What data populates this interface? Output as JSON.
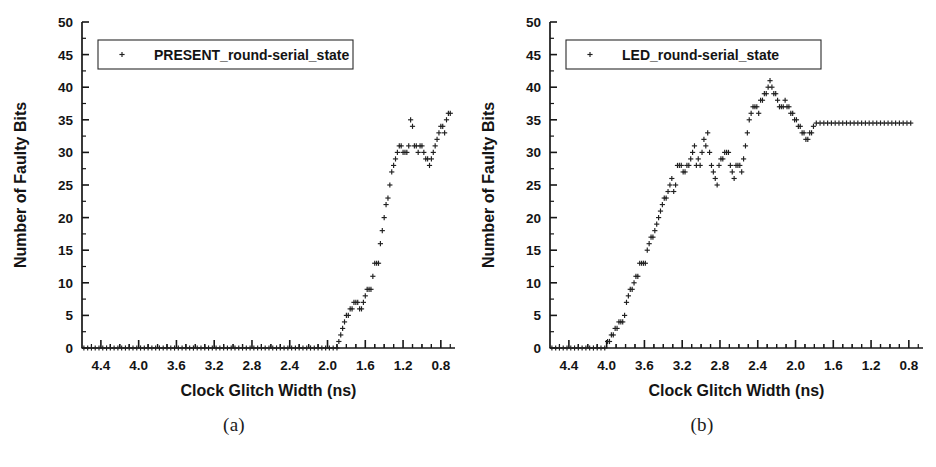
{
  "figure": {
    "panels": [
      {
        "id": "a",
        "caption": "(a)",
        "legend_label": "PRESENT_round-serial_state",
        "marker_symbol": "+"
      },
      {
        "id": "b",
        "caption": "(b)",
        "legend_label": "LED_round-serial_state",
        "marker_symbol": "+"
      }
    ]
  },
  "chart_data": [
    {
      "type": "scatter",
      "title": "",
      "panel": "(a)",
      "xlabel": "Clock Glitch Width (ns)",
      "ylabel": "Number of Faulty Bits",
      "legend": [
        "PRESENT_round-serial_state"
      ],
      "legend_position": "top-left",
      "grid": false,
      "x_axis_reversed": true,
      "xlim": [
        4.6,
        0.65
      ],
      "ylim": [
        0,
        50
      ],
      "xticks": [
        4.4,
        4.0,
        3.6,
        3.2,
        2.8,
        2.4,
        2.0,
        1.6,
        1.2,
        0.8
      ],
      "xtick_labels": [
        "4.4",
        "4.0",
        "3.6",
        "3.2",
        "2.8",
        "2.4",
        "2.0",
        "1.6",
        "1.2",
        "0.8"
      ],
      "yticks": [
        0,
        5,
        10,
        15,
        20,
        25,
        30,
        35,
        40,
        45,
        50
      ],
      "ytick_labels": [
        "0",
        "5",
        "10",
        "15",
        "20",
        "25",
        "30",
        "35",
        "40",
        "45",
        "50"
      ],
      "x_minor_ticks_per_major": 2,
      "y_minor_ticks_per_major": 1,
      "series": [
        {
          "name": "PRESENT_round-serial_state",
          "marker": "+",
          "color": "#202020",
          "x": [
            4.58,
            4.54,
            4.5,
            4.46,
            4.42,
            4.38,
            4.34,
            4.3,
            4.26,
            4.22,
            4.18,
            4.14,
            4.1,
            4.06,
            4.02,
            3.98,
            3.94,
            3.9,
            3.86,
            3.82,
            3.78,
            3.74,
            3.7,
            3.66,
            3.62,
            3.58,
            3.54,
            3.5,
            3.46,
            3.42,
            3.38,
            3.34,
            3.3,
            3.26,
            3.22,
            3.18,
            3.14,
            3.1,
            3.06,
            3.02,
            2.98,
            2.94,
            2.9,
            2.86,
            2.82,
            2.78,
            2.74,
            2.7,
            2.66,
            2.62,
            2.58,
            2.54,
            2.5,
            2.46,
            2.42,
            2.38,
            2.34,
            2.3,
            2.26,
            2.22,
            2.18,
            2.14,
            2.1,
            2.06,
            2.02,
            1.98,
            1.94,
            1.9,
            1.88,
            1.86,
            1.84,
            1.82,
            1.8,
            1.78,
            1.76,
            1.74,
            1.72,
            1.7,
            1.68,
            1.66,
            1.64,
            1.62,
            1.6,
            1.58,
            1.56,
            1.54,
            1.52,
            1.5,
            1.48,
            1.46,
            1.44,
            1.42,
            1.4,
            1.38,
            1.36,
            1.34,
            1.32,
            1.3,
            1.28,
            1.26,
            1.24,
            1.22,
            1.2,
            1.18,
            1.16,
            1.14,
            1.12,
            1.1,
            1.08,
            1.06,
            1.04,
            1.02,
            1.0,
            0.98,
            0.96,
            0.94,
            0.92,
            0.9,
            0.88,
            0.86,
            0.84,
            0.82,
            0.8,
            0.78,
            0.76,
            0.74,
            0.72,
            0.7
          ],
          "y": [
            0,
            0,
            0,
            0,
            0,
            0,
            0,
            0,
            0,
            0,
            0,
            0,
            0,
            0,
            0,
            0,
            0,
            0,
            0,
            0,
            0,
            0,
            0,
            0,
            0,
            0,
            0,
            0,
            0,
            0,
            0,
            0,
            0,
            0,
            0,
            0,
            0,
            0,
            0,
            0,
            0,
            0,
            0,
            0,
            0,
            0,
            0,
            0,
            0,
            0,
            0,
            0,
            0,
            0,
            0,
            0,
            0,
            0,
            0,
            0,
            0,
            0,
            0,
            0,
            0,
            0,
            0,
            0,
            1,
            2,
            3,
            4,
            5,
            5,
            6,
            6,
            7,
            7,
            7,
            6,
            6,
            7,
            8,
            9,
            9,
            9,
            11,
            13,
            13,
            13,
            16,
            18,
            20,
            22,
            23,
            25,
            27,
            28,
            29,
            30,
            31,
            31,
            30,
            30,
            30,
            31,
            35,
            34,
            31,
            31,
            30,
            31,
            31,
            30,
            29,
            29,
            28,
            29,
            30,
            31,
            32,
            33,
            34,
            34,
            33,
            35,
            36,
            36,
            37,
            40,
            39,
            37,
            37,
            37,
            37,
            37,
            37,
            37
          ]
        }
      ]
    },
    {
      "type": "scatter",
      "title": "",
      "panel": "(b)",
      "xlabel": "Clock Glitch Width (ns)",
      "ylabel": "Number of Faulty Bits",
      "legend": [
        "LED_round-serial_state"
      ],
      "legend_position": "top-left",
      "grid": false,
      "x_axis_reversed": true,
      "xlim": [
        4.6,
        0.65
      ],
      "ylim": [
        0,
        50
      ],
      "xticks": [
        4.4,
        4.0,
        3.6,
        3.2,
        2.8,
        2.4,
        2.0,
        1.6,
        1.2,
        0.8
      ],
      "xtick_labels": [
        "4.4",
        "4.0",
        "3.6",
        "3.2",
        "2.8",
        "2.4",
        "2.0",
        "1.6",
        "1.2",
        "0.8"
      ],
      "yticks": [
        0,
        5,
        10,
        15,
        20,
        25,
        30,
        35,
        40,
        45,
        50
      ],
      "ytick_labels": [
        "0",
        "5",
        "10",
        "15",
        "20",
        "25",
        "30",
        "35",
        "40",
        "45",
        "50"
      ],
      "x_minor_ticks_per_major": 2,
      "y_minor_ticks_per_major": 1,
      "series": [
        {
          "name": "LED_round-serial_state",
          "marker": "+",
          "color": "#202020",
          "x": [
            4.58,
            4.54,
            4.5,
            4.46,
            4.42,
            4.38,
            4.34,
            4.3,
            4.26,
            4.22,
            4.18,
            4.14,
            4.1,
            4.06,
            4.02,
            3.99,
            3.97,
            3.95,
            3.93,
            3.91,
            3.89,
            3.87,
            3.85,
            3.83,
            3.81,
            3.79,
            3.77,
            3.75,
            3.73,
            3.71,
            3.69,
            3.67,
            3.65,
            3.63,
            3.61,
            3.59,
            3.57,
            3.55,
            3.53,
            3.51,
            3.49,
            3.47,
            3.45,
            3.43,
            3.41,
            3.39,
            3.37,
            3.35,
            3.33,
            3.31,
            3.29,
            3.27,
            3.25,
            3.23,
            3.21,
            3.19,
            3.17,
            3.15,
            3.13,
            3.11,
            3.09,
            3.07,
            3.05,
            3.03,
            3.01,
            2.99,
            2.97,
            2.95,
            2.93,
            2.91,
            2.89,
            2.87,
            2.85,
            2.83,
            2.81,
            2.79,
            2.77,
            2.75,
            2.73,
            2.71,
            2.69,
            2.67,
            2.65,
            2.63,
            2.61,
            2.59,
            2.57,
            2.55,
            2.53,
            2.51,
            2.49,
            2.47,
            2.45,
            2.43,
            2.41,
            2.39,
            2.37,
            2.35,
            2.33,
            2.31,
            2.29,
            2.27,
            2.25,
            2.23,
            2.21,
            2.19,
            2.17,
            2.15,
            2.13,
            2.11,
            2.09,
            2.07,
            2.05,
            2.03,
            2.01,
            1.99,
            1.97,
            1.95,
            1.93,
            1.91,
            1.89,
            1.87,
            1.85,
            1.83,
            1.81,
            1.78,
            1.74,
            1.7,
            1.66,
            1.62,
            1.58,
            1.54,
            1.5,
            1.46,
            1.42,
            1.38,
            1.34,
            1.3,
            1.26,
            1.22,
            1.18,
            1.14,
            1.1,
            1.06,
            1.02,
            0.98,
            0.94,
            0.9,
            0.86,
            0.82,
            0.78
          ],
          "y": [
            0,
            0,
            0,
            0,
            0,
            0,
            0,
            0,
            0,
            0,
            0,
            0,
            0,
            0,
            0,
            1,
            1,
            2,
            2,
            3,
            3,
            4,
            4,
            4,
            5,
            7,
            8,
            9,
            9,
            10,
            11,
            11,
            13,
            13,
            13,
            13,
            15,
            16,
            17,
            17,
            18,
            19,
            20,
            21,
            22,
            23,
            23,
            24,
            25,
            26,
            24,
            25,
            28,
            28,
            28,
            27,
            27,
            28,
            28,
            29,
            30,
            31,
            28,
            29,
            28,
            30,
            32,
            31,
            33,
            30,
            28,
            27,
            26,
            25,
            28,
            29,
            29,
            30,
            30,
            30,
            28,
            27,
            26,
            28,
            28,
            28,
            27,
            29,
            31,
            33,
            35,
            36,
            37,
            37,
            37,
            36,
            38,
            38,
            39,
            39,
            40,
            41,
            40,
            39,
            39,
            38,
            37,
            37,
            37,
            38,
            37,
            37,
            36,
            36,
            35,
            35,
            34,
            34,
            33,
            33,
            32,
            32,
            33,
            33,
            34,
            34.5,
            34.5,
            34.5,
            34.5,
            34.5,
            34.5,
            34.5,
            34.5,
            34.5,
            34.5,
            34.5,
            34.5,
            34.5,
            34.5,
            34.5,
            34.5,
            34.5,
            34.5,
            34.5,
            34.5,
            34.5,
            34.5,
            34.5,
            34.5,
            34.5,
            34.5
          ]
        }
      ]
    }
  ]
}
